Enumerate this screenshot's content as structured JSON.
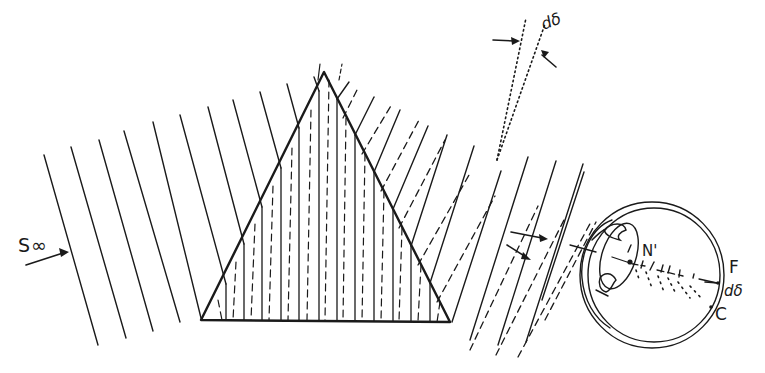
{
  "figure": {
    "labels": {
      "source": "S∞",
      "angle_top": "dδ",
      "nodal_point": "N'",
      "focus_f": "F",
      "angle_eye": "dδ",
      "focus_c": "C"
    },
    "legend_semantics": {
      "solid_lines": "rays of one wavelength (F)",
      "dashed_lines": "rays of second wavelength (C)",
      "dotted_lines": "extended ray directions showing angular spread dδ"
    },
    "colors": {
      "ink": "#1a1a1a",
      "background": "#ffffff"
    },
    "prism": {
      "apex": [
        324,
        72
      ],
      "base_left": [
        201,
        320
      ],
      "base_right": [
        450,
        322
      ]
    },
    "eye": {
      "center": [
        652,
        275
      ],
      "radius_x": 72,
      "radius_y": 73
    }
  }
}
